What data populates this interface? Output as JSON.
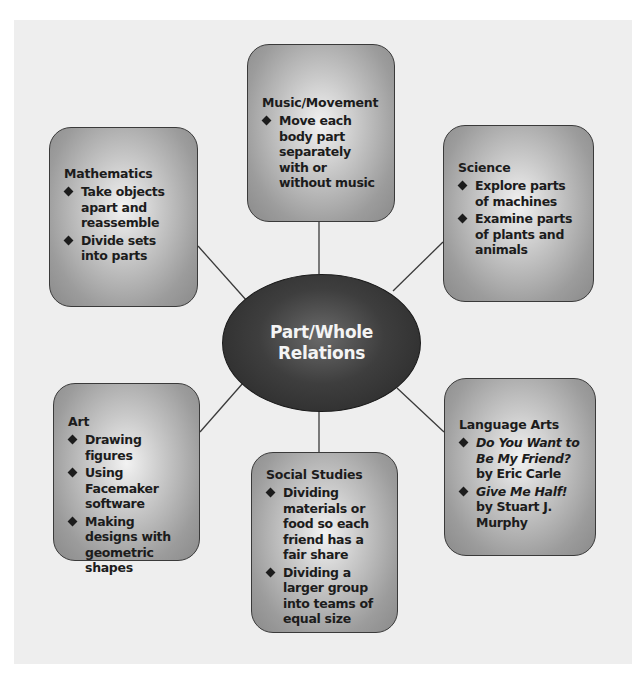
{
  "diagram": {
    "center": {
      "line1": "Part/Whole",
      "line2": "Relations"
    },
    "nodes": {
      "music": {
        "title": "Music/Movement",
        "items": [
          "Move each body part separately with or without music"
        ]
      },
      "math": {
        "title": "Mathematics",
        "items": [
          "Take objects apart and reassemble",
          "Divide sets into parts"
        ]
      },
      "science": {
        "title": "Science",
        "items": [
          "Explore parts of machines",
          "Examine parts of plants and animals"
        ]
      },
      "art": {
        "title": "Art",
        "items": [
          "Drawing figures",
          "Using Facemaker software",
          "Making designs with geometric shapes"
        ]
      },
      "social": {
        "title": "Social Studies",
        "items": [
          "Dividing materials or food so each friend has a fair share",
          "Dividing a larger group into teams of equal size"
        ]
      },
      "language": {
        "title": "Language Arts",
        "items": [
          {
            "book": "Do You Want to Be My Friend?",
            "author": " by Eric Carle"
          },
          {
            "book": "Give Me Half!",
            "author": " by Stuart J. Murphy"
          }
        ]
      }
    },
    "colors": {
      "panel": "#eeeeee",
      "box_edge": "#8a8a8a",
      "box_center": "#f2f2f2",
      "hub": "#2b2b2b",
      "hub_text": "#f4f4f4",
      "line": "#3a3a3a"
    }
  }
}
